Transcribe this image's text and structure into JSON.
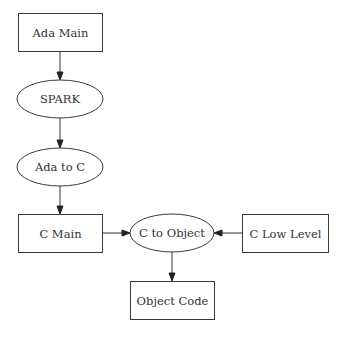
{
  "diagram": {
    "type": "flowchart",
    "nodes": [
      {
        "id": "ada_main",
        "label": "Ada Main",
        "shape": "box",
        "x": 18,
        "y": 13,
        "w": 84,
        "h": 38
      },
      {
        "id": "spark",
        "label": "SPARK",
        "shape": "ellipse",
        "cx": 60,
        "cy": 99,
        "rx": 43,
        "ry": 19
      },
      {
        "id": "ada_to_c",
        "label": "Ada to C",
        "shape": "ellipse",
        "cx": 60,
        "cy": 167,
        "rx": 43,
        "ry": 19
      },
      {
        "id": "c_main",
        "label": "C Main",
        "shape": "box",
        "x": 18,
        "y": 214,
        "w": 84,
        "h": 38
      },
      {
        "id": "c_to_object",
        "label": "C to Object",
        "shape": "ellipse",
        "cx": 172,
        "cy": 233,
        "rx": 42,
        "ry": 19
      },
      {
        "id": "c_low_level",
        "label": "C Low Level",
        "shape": "box",
        "x": 242,
        "y": 214,
        "w": 86,
        "h": 38
      },
      {
        "id": "object_code",
        "label": "Object Code",
        "shape": "box",
        "x": 130,
        "y": 281,
        "w": 84,
        "h": 38
      }
    ],
    "edges": [
      {
        "from": "ada_main",
        "to": "spark",
        "x1": 60,
        "y1": 51,
        "x2": 60,
        "y2": 80
      },
      {
        "from": "spark",
        "to": "ada_to_c",
        "x1": 60,
        "y1": 118,
        "x2": 60,
        "y2": 148
      },
      {
        "from": "ada_to_c",
        "to": "c_main",
        "x1": 60,
        "y1": 186,
        "x2": 60,
        "y2": 214
      },
      {
        "from": "c_main",
        "to": "c_to_object",
        "x1": 102,
        "y1": 233,
        "x2": 130,
        "y2": 233
      },
      {
        "from": "c_low_level",
        "to": "c_to_object",
        "x1": 242,
        "y1": 233,
        "x2": 214,
        "y2": 233
      },
      {
        "from": "c_to_object",
        "to": "object_code",
        "x1": 172,
        "y1": 252,
        "x2": 172,
        "y2": 281
      }
    ]
  }
}
